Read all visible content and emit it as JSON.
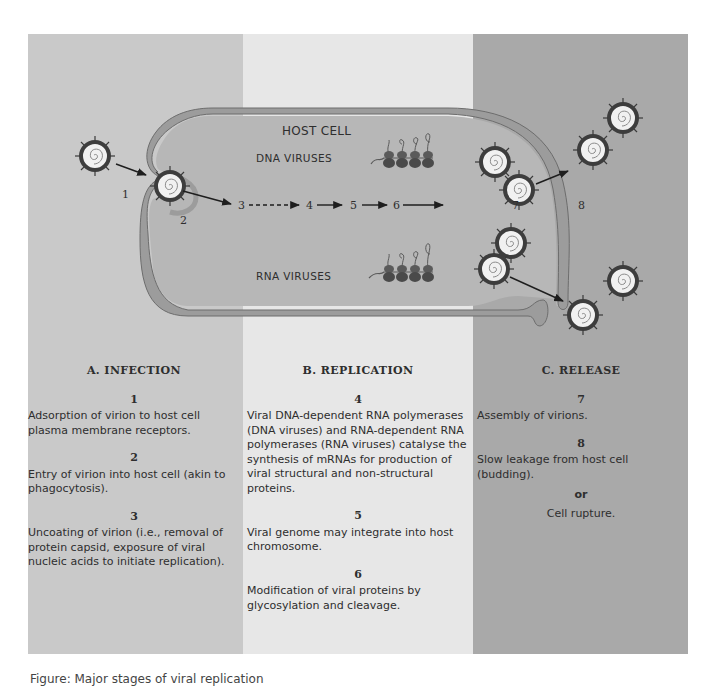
{
  "diagram": {
    "title": "HOST CELL",
    "dna_label": "DNA VIRUSES",
    "rna_label": "RNA VIRUSES",
    "step_markers": [
      "1",
      "2",
      "3",
      "4",
      "5",
      "6",
      "7",
      "8"
    ],
    "colors": {
      "infection_bg": "#c9c9c9",
      "replication_bg": "#e7e7e7",
      "release_bg": "#a9a9a9",
      "cell_interior": "#b7b7b7",
      "membrane": "#9c9c9c",
      "virion_shell": "#3f3f3f",
      "virion_core": "#f2f2f2"
    }
  },
  "sections": {
    "infection": {
      "title": "A.  INFECTION",
      "steps": [
        {
          "num": "1",
          "text": "Adsorption of virion to host cell plasma membrane receptors."
        },
        {
          "num": "2",
          "text": "Entry of virion into host cell (akin to phagocytosis)."
        },
        {
          "num": "3",
          "text": "Uncoating of virion (i.e., removal of protein capsid, exposure of viral nucleic acids to initiate replication)."
        }
      ]
    },
    "replication": {
      "title": "B.  REPLICATION",
      "steps": [
        {
          "num": "4",
          "text": "Viral DNA-dependent RNA polymerases (DNA viruses) and RNA-dependent RNA polymerases (RNA viruses) catalyse the synthesis of mRNAs for production of viral structural and non-structural proteins."
        },
        {
          "num": "5",
          "text": "Viral genome may integrate into host chromosome."
        },
        {
          "num": "6",
          "text": "Modification of viral proteins by glycosylation and cleavage."
        }
      ]
    },
    "release": {
      "title": "C.  RELEASE",
      "steps": [
        {
          "num": "7",
          "text": "Assembly of virions."
        },
        {
          "num": "8",
          "text": "Slow leakage from host cell (budding)."
        }
      ],
      "or_label": "or",
      "alt_text": "Cell rupture."
    }
  },
  "caption": "Figure: Major stages of viral replication"
}
